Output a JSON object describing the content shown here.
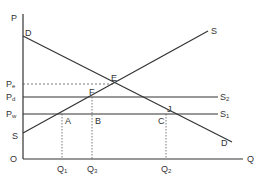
{
  "diagram": {
    "axes": {
      "y_label": "P",
      "x_label": "Q",
      "origin_label": "O"
    },
    "curves": {
      "demand": {
        "label_top": "D",
        "label_bottom": "D"
      },
      "supply": {
        "label_top": "S",
        "label_bottom": "S"
      },
      "s1": {
        "label": "S",
        "sub": "1"
      },
      "s2": {
        "label": "S",
        "sub": "2"
      }
    },
    "price_levels": [
      {
        "label": "P",
        "sub": "e",
        "style": "dashed"
      },
      {
        "label": "P",
        "sub": "d",
        "style": "solid"
      },
      {
        "label": "P",
        "sub": "w",
        "style": "solid"
      }
    ],
    "quantities": [
      {
        "label": "Q",
        "sub": "1"
      },
      {
        "label": "Q",
        "sub": "3"
      },
      {
        "label": "Q",
        "sub": "2"
      }
    ],
    "points": {
      "E": "E",
      "F": "F",
      "J": "J",
      "A": "A",
      "B": "B",
      "C": "C"
    },
    "colors": {
      "line": "#333333",
      "dashed": "#555555",
      "background": "#ffffff"
    }
  }
}
